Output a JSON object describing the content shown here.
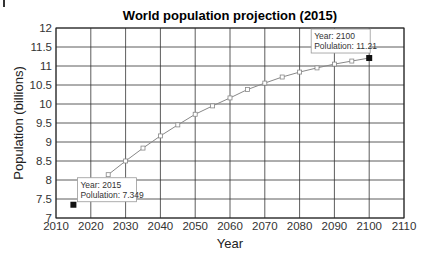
{
  "chart_data": {
    "type": "line",
    "title": "World population projection (2015)",
    "xlabel": "Year",
    "ylabel": "Population (billions)",
    "xlim": [
      2010,
      2110
    ],
    "ylim": [
      7,
      12
    ],
    "xticks": [
      2010,
      2020,
      2030,
      2040,
      2050,
      2060,
      2070,
      2080,
      2090,
      2100,
      2110
    ],
    "yticks": [
      7,
      7.5,
      8,
      8.5,
      9,
      9.5,
      10,
      10.5,
      11,
      11.5,
      12
    ],
    "ytick_labels": [
      "7",
      "7.5",
      "8",
      "8.5",
      "9",
      "9.5",
      "10",
      "10.5",
      "11",
      "11.5",
      "12"
    ],
    "grid": true,
    "legend": null,
    "series": [
      {
        "name": "Population projection",
        "x": [
          2025,
          2030,
          2035,
          2040,
          2045,
          2050,
          2055,
          2060,
          2065,
          2070,
          2075,
          2080,
          2085,
          2090,
          2095,
          2100
        ],
        "values": [
          8.14,
          8.5,
          8.84,
          9.16,
          9.45,
          9.73,
          9.95,
          10.16,
          10.38,
          10.55,
          10.71,
          10.84,
          10.95,
          11.05,
          11.13,
          11.21
        ],
        "marker": "open-square",
        "color": "#888888"
      }
    ],
    "highlighted_points": [
      {
        "x": 2015,
        "y": 7.349,
        "label_line1": "Year: 2015",
        "label_line2": "Polulation: 7.349"
      },
      {
        "x": 2100,
        "y": 11.21,
        "label_line1": "Year: 2100",
        "label_line2": "Polulation: 11.21"
      }
    ]
  },
  "colors": {
    "grid": "#333333",
    "line": "#999999",
    "marker_fill": "#111111",
    "tooltip_border": "#999999"
  }
}
